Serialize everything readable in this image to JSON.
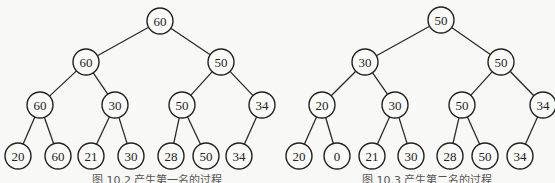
{
  "figures": [
    {
      "id": "left",
      "caption": "图 10.2  产生第一名的过程",
      "nodes": [
        {
          "id": "a0",
          "label": "60",
          "x": 160,
          "y": 21
        },
        {
          "id": "a1",
          "label": "60",
          "x": 86,
          "y": 62
        },
        {
          "id": "a2",
          "label": "50",
          "x": 221,
          "y": 62
        },
        {
          "id": "a3",
          "label": "60",
          "x": 40,
          "y": 105
        },
        {
          "id": "a4",
          "label": "30",
          "x": 115,
          "y": 105
        },
        {
          "id": "a5",
          "label": "50",
          "x": 182,
          "y": 105
        },
        {
          "id": "a6",
          "label": "34",
          "x": 262,
          "y": 105
        },
        {
          "id": "a7",
          "label": "20",
          "x": 18,
          "y": 156
        },
        {
          "id": "a8",
          "label": "60",
          "x": 58,
          "y": 156
        },
        {
          "id": "a9",
          "label": "21",
          "x": 91,
          "y": 156
        },
        {
          "id": "a10",
          "label": "30",
          "x": 131,
          "y": 156
        },
        {
          "id": "a11",
          "label": "28",
          "x": 171,
          "y": 156
        },
        {
          "id": "a12",
          "label": "50",
          "x": 206,
          "y": 156
        },
        {
          "id": "a13",
          "label": "34",
          "x": 239,
          "y": 156
        }
      ],
      "edges": [
        [
          "a0",
          "a1"
        ],
        [
          "a0",
          "a2"
        ],
        [
          "a1",
          "a3"
        ],
        [
          "a1",
          "a4"
        ],
        [
          "a2",
          "a5"
        ],
        [
          "a2",
          "a6"
        ],
        [
          "a3",
          "a7"
        ],
        [
          "a3",
          "a8"
        ],
        [
          "a4",
          "a9"
        ],
        [
          "a4",
          "a10"
        ],
        [
          "a5",
          "a11"
        ],
        [
          "a5",
          "a12"
        ],
        [
          "a6",
          "a13"
        ]
      ]
    },
    {
      "id": "right",
      "caption": "图 10.3  产生第二名的过程",
      "nodes": [
        {
          "id": "b0",
          "label": "50",
          "x": 441,
          "y": 20
        },
        {
          "id": "b1",
          "label": "30",
          "x": 365,
          "y": 62
        },
        {
          "id": "b2",
          "label": "50",
          "x": 501,
          "y": 62
        },
        {
          "id": "b3",
          "label": "20",
          "x": 322,
          "y": 105
        },
        {
          "id": "b4",
          "label": "30",
          "x": 395,
          "y": 105
        },
        {
          "id": "b5",
          "label": "50",
          "x": 462,
          "y": 105
        },
        {
          "id": "b6",
          "label": "34",
          "x": 543,
          "y": 105
        },
        {
          "id": "b7",
          "label": "20",
          "x": 299,
          "y": 156
        },
        {
          "id": "b8",
          "label": "0",
          "x": 337,
          "y": 156
        },
        {
          "id": "b9",
          "label": "21",
          "x": 372,
          "y": 156
        },
        {
          "id": "b10",
          "label": "30",
          "x": 411,
          "y": 156
        },
        {
          "id": "b11",
          "label": "28",
          "x": 450,
          "y": 156
        },
        {
          "id": "b12",
          "label": "50",
          "x": 485,
          "y": 156
        },
        {
          "id": "b13",
          "label": "34",
          "x": 520,
          "y": 156
        }
      ],
      "edges": [
        [
          "b0",
          "b1"
        ],
        [
          "b0",
          "b2"
        ],
        [
          "b1",
          "b3"
        ],
        [
          "b1",
          "b4"
        ],
        [
          "b2",
          "b5"
        ],
        [
          "b2",
          "b6"
        ],
        [
          "b3",
          "b7"
        ],
        [
          "b3",
          "b8"
        ],
        [
          "b4",
          "b9"
        ],
        [
          "b4",
          "b10"
        ],
        [
          "b5",
          "b11"
        ],
        [
          "b5",
          "b12"
        ],
        [
          "b6",
          "b13"
        ]
      ]
    }
  ],
  "style": {
    "node_radius": 13,
    "stroke": "#222222",
    "background": "#f8f8f6"
  }
}
